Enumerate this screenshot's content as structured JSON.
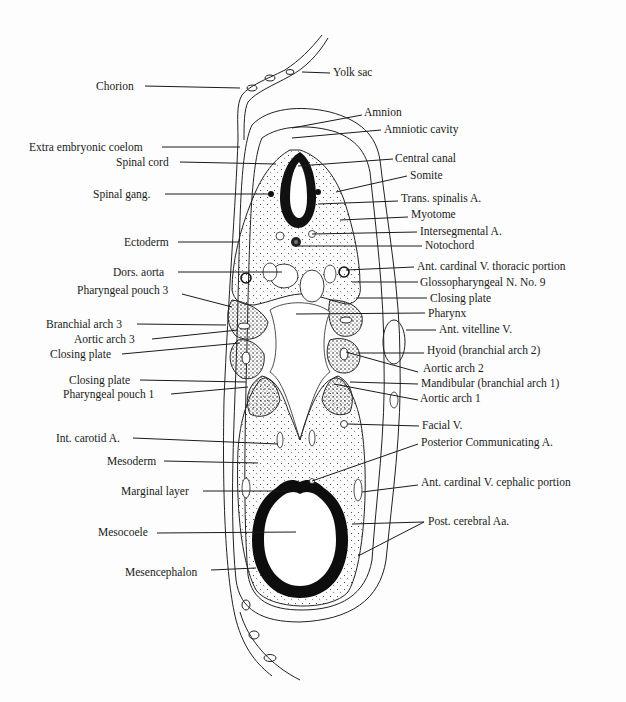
{
  "diagram": {
    "left_labels": [
      {
        "id": "chorion",
        "text": "Chorion",
        "x": 96,
        "y": 80,
        "lx1": 145,
        "ly1": 86,
        "lx2": 240,
        "ly2": 88
      },
      {
        "id": "extra-embryonic-coelom",
        "text": "Extra embryonic coelom",
        "x": 29,
        "y": 141,
        "lx1": 162,
        "ly1": 147,
        "lx2": 240,
        "ly2": 147
      },
      {
        "id": "spinal-cord",
        "text": "Spinal cord",
        "x": 116,
        "y": 156,
        "lx1": 180,
        "ly1": 162,
        "lx2": 276,
        "ly2": 164
      },
      {
        "id": "spinal-gang",
        "text": "Spinal gang.",
        "x": 93,
        "y": 188,
        "lx1": 165,
        "ly1": 194,
        "lx2": 270,
        "ly2": 194
      },
      {
        "id": "ectoderm",
        "text": "Ectoderm",
        "x": 124,
        "y": 236,
        "lx1": 178,
        "ly1": 242,
        "lx2": 238,
        "ly2": 242
      },
      {
        "id": "dors-aorta",
        "text": "Dors. aorta",
        "x": 113,
        "y": 266,
        "lx1": 178,
        "ly1": 272,
        "lx2": 282,
        "ly2": 272
      },
      {
        "id": "pharyngeal-pouch-3",
        "text": "Pharyngeal pouch 3",
        "x": 77,
        "y": 284,
        "lx1": 182,
        "ly1": 294,
        "lx2": 232,
        "ly2": 307
      },
      {
        "id": "branchial-arch-3",
        "text": "Branchial arch 3",
        "x": 46,
        "y": 318,
        "lx1": 137,
        "ly1": 324,
        "lx2": 226,
        "ly2": 325
      },
      {
        "id": "aortic-arch-3",
        "text": "Aortic arch 3",
        "x": 74,
        "y": 333,
        "lx1": 152,
        "ly1": 339,
        "lx2": 238,
        "ly2": 330
      },
      {
        "id": "closing-plate-left-1",
        "text": "Closing plate",
        "x": 50,
        "y": 348,
        "lx1": 122,
        "ly1": 354,
        "lx2": 240,
        "ly2": 343
      },
      {
        "id": "closing-plate-left-2",
        "text": "Closing plate",
        "x": 69,
        "y": 374,
        "lx1": 140,
        "ly1": 380,
        "lx2": 246,
        "ly2": 382
      },
      {
        "id": "pharyngeal-pouch-1",
        "text": "Pharyngeal pouch 1",
        "x": 63,
        "y": 388,
        "lx1": 171,
        "ly1": 394,
        "lx2": 248,
        "ly2": 387
      },
      {
        "id": "int-carotid-a",
        "text": "Int. carotid A.",
        "x": 56,
        "y": 432,
        "lx1": 133,
        "ly1": 438,
        "lx2": 278,
        "ly2": 444
      },
      {
        "id": "mesoderm",
        "text": "Mesoderm",
        "x": 107,
        "y": 455,
        "lx1": 164,
        "ly1": 461,
        "lx2": 258,
        "ly2": 463
      },
      {
        "id": "marginal-layer",
        "text": "Marginal layer",
        "x": 121,
        "y": 485,
        "lx1": 203,
        "ly1": 491,
        "lx2": 290,
        "ly2": 491
      },
      {
        "id": "mesocoele",
        "text": "Mesocoele",
        "x": 98,
        "y": 526,
        "lx1": 157,
        "ly1": 533,
        "lx2": 296,
        "ly2": 532
      },
      {
        "id": "mesencephalon",
        "text": "Mesencephalon",
        "x": 125,
        "y": 566,
        "lx1": 211,
        "ly1": 570,
        "lx2": 256,
        "ly2": 568
      }
    ],
    "right_labels": [
      {
        "id": "yolk-sac",
        "text": "Yolk sac",
        "x": 333,
        "y": 66,
        "lx1": 330,
        "ly1": 73,
        "lx2": 302,
        "ly2": 72
      },
      {
        "id": "amnion",
        "text": "Amnion",
        "x": 364,
        "y": 106,
        "lx1": 362,
        "ly1": 115,
        "lx2": 292,
        "ly2": 128
      },
      {
        "id": "amniotic-cavity",
        "text": "Amniotic cavity",
        "x": 384,
        "y": 123,
        "lx1": 381,
        "ly1": 130,
        "lx2": 292,
        "ly2": 138
      },
      {
        "id": "central-canal",
        "text": "Central canal",
        "x": 395,
        "y": 152,
        "lx1": 393,
        "ly1": 159,
        "lx2": 298,
        "ly2": 166
      },
      {
        "id": "somite",
        "text": "Somite",
        "x": 410,
        "y": 169,
        "lx1": 407,
        "ly1": 176,
        "lx2": 336,
        "ly2": 192
      },
      {
        "id": "trans-spinalis-a",
        "text": "Trans. spinalis A.",
        "x": 401,
        "y": 192,
        "lx1": 398,
        "ly1": 201,
        "lx2": 318,
        "ly2": 204
      },
      {
        "id": "myotome",
        "text": "Myotome",
        "x": 411,
        "y": 208,
        "lx1": 408,
        "ly1": 217,
        "lx2": 340,
        "ly2": 220
      },
      {
        "id": "intersegmental-a",
        "text": "Intersegmental A.",
        "x": 420,
        "y": 225,
        "lx1": 417,
        "ly1": 232,
        "lx2": 312,
        "ly2": 234
      },
      {
        "id": "notochord",
        "text": "Notochord",
        "x": 425,
        "y": 239,
        "lx1": 422,
        "ly1": 246,
        "lx2": 298,
        "ly2": 246
      },
      {
        "id": "ant-cardinal-v-thoracic",
        "text": "Ant. cardinal V. thoracic portion",
        "x": 417,
        "y": 260,
        "lx1": 414,
        "ly1": 267,
        "lx2": 346,
        "ly2": 270
      },
      {
        "id": "glossopharyngeal-n-9",
        "text": "Glossopharyngeal N. No. 9",
        "x": 420,
        "y": 276,
        "lx1": 418,
        "ly1": 282,
        "lx2": 352,
        "ly2": 282
      },
      {
        "id": "closing-plate-right",
        "text": "Closing plate",
        "x": 430,
        "y": 292,
        "lx1": 427,
        "ly1": 298,
        "lx2": 356,
        "ly2": 298
      },
      {
        "id": "pharynx",
        "text": "Pharynx",
        "x": 428,
        "y": 307,
        "lx1": 425,
        "ly1": 313,
        "lx2": 296,
        "ly2": 314
      },
      {
        "id": "ant-vitelline-v",
        "text": "Ant. vitelline V.",
        "x": 439,
        "y": 323,
        "lx1": 436,
        "ly1": 330,
        "lx2": 406,
        "ly2": 330
      },
      {
        "id": "hyoid",
        "text": "Hyoid (branchial arch 2)",
        "x": 427,
        "y": 344,
        "lx1": 424,
        "ly1": 353,
        "lx2": 358,
        "ly2": 353
      },
      {
        "id": "aortic-arch-2",
        "text": "Aortic arch 2",
        "x": 423,
        "y": 362,
        "lx1": 418,
        "ly1": 372,
        "lx2": 346,
        "ly2": 352
      },
      {
        "id": "mandibular",
        "text": "Mandibular (branchial arch 1)",
        "x": 421,
        "y": 377,
        "lx1": 418,
        "ly1": 384,
        "lx2": 350,
        "ly2": 382
      },
      {
        "id": "aortic-arch-1",
        "text": "Aortic arch 1",
        "x": 420,
        "y": 392,
        "lx1": 418,
        "ly1": 400,
        "lx2": 334,
        "ly2": 384
      },
      {
        "id": "facial-v",
        "text": "Facial V.",
        "x": 422,
        "y": 419,
        "lx1": 419,
        "ly1": 426,
        "lx2": 348,
        "ly2": 424
      },
      {
        "id": "posterior-communicating-a",
        "text": "Posterior Communicating A.",
        "x": 421,
        "y": 436,
        "lx1": 418,
        "ly1": 444,
        "lx2": 312,
        "ly2": 481
      },
      {
        "id": "ant-cardinal-v-cephalic",
        "text": "Ant. cardinal V. cephalic portion",
        "x": 421,
        "y": 476,
        "lx1": 418,
        "ly1": 485,
        "lx2": 362,
        "ly2": 492
      },
      {
        "id": "post-cerebral-aa",
        "text": "Post. cerebral Aa.",
        "x": 428,
        "y": 515,
        "lx1": 424,
        "ly1": 522,
        "lx2": 352,
        "ly2": 524
      }
    ],
    "extra_leader": {
      "id": "post-cerebral-aa-2",
      "lx1": 424,
      "ly1": 522,
      "lx2": 358,
      "ly2": 556
    }
  }
}
